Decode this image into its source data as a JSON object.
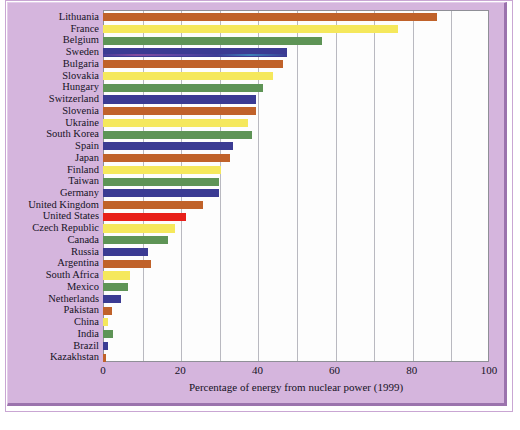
{
  "figure": {
    "background_color": "#d5b5dd",
    "plot_background": "#fdfdfd",
    "border_color": "#9b73ad"
  },
  "axis": {
    "xlabel": "Percentage of energy from nuclear power (1999)",
    "ticks": [
      "0",
      "20",
      "40",
      "60",
      "80",
      "100"
    ],
    "tick_values": [
      0,
      20,
      40,
      60,
      80,
      100
    ],
    "gridline_step": 10
  },
  "palette": {
    "orange": "#c0622a",
    "yellow": "#f5e85c",
    "green": "#5e9456",
    "blue": "#3b3b93",
    "highlight_red": "#e8201a"
  },
  "chart_data": {
    "type": "bar",
    "orientation": "horizontal",
    "title": "",
    "xlabel": "Percentage of energy from nuclear power (1999)",
    "ylabel": "",
    "xlim": [
      0,
      100
    ],
    "grid": true,
    "legend": "none",
    "categories": [
      "Lithuania",
      "France",
      "Belgium",
      "Sweden",
      "Bulgaria",
      "Slovakia",
      "Hungary",
      "Switzerland",
      "Slovenia",
      "Ukraine",
      "South Korea",
      "Spain",
      "Japan",
      "Finland",
      "Taiwan",
      "Germany",
      "United Kingdom",
      "United States",
      "Czech Republic",
      "Canada",
      "Russia",
      "Argentina",
      "South Africa",
      "Mexico",
      "Netherlands",
      "Pakistan",
      "China",
      "India",
      "Brazil",
      "Kazakhstan"
    ],
    "values": [
      86.5,
      76.4,
      56.7,
      47.6,
      46.6,
      44.0,
      41.5,
      39.6,
      39.6,
      37.6,
      38.6,
      33.7,
      32.9,
      30.6,
      30.0,
      30.0,
      26.0,
      21.5,
      18.6,
      16.8,
      11.6,
      12.4,
      7.0,
      6.5,
      4.7,
      2.4,
      1.3,
      2.5,
      1.3,
      0.8
    ],
    "bar_colors": [
      "#c0622a",
      "#f5e85c",
      "#5e9456",
      "#3b3b93",
      "#c0622a",
      "#f5e85c",
      "#5e9456",
      "#3b3b93",
      "#c0622a",
      "#f5e85c",
      "#5e9456",
      "#3b3b93",
      "#c0622a",
      "#f5e85c",
      "#5e9456",
      "#3b3b93",
      "#c0622a",
      "#e8201a",
      "#f5e85c",
      "#5e9456",
      "#3b3b93",
      "#c0622a",
      "#f5e85c",
      "#5e9456",
      "#3b3b93",
      "#c0622a",
      "#f5e85c",
      "#5e9456",
      "#3b3b93",
      "#c0622a"
    ]
  }
}
